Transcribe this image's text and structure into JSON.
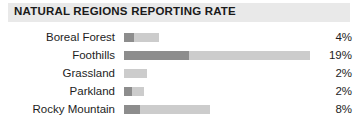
{
  "header": {
    "title": "NATURAL REGIONS REPORTING RATE",
    "band_color": "#e9e9e9"
  },
  "colors": {
    "bar_dark": "#8d8d8d",
    "bar_light": "#cccccc",
    "text": "#1d1d1d",
    "background": "#ffffff"
  },
  "chart_data": {
    "type": "bar",
    "title": "NATURAL REGIONS REPORTING RATE",
    "xlabel": "",
    "ylabel": "",
    "orientation": "horizontal",
    "grid": false,
    "legend": "none",
    "value_suffix": "%",
    "xlim": [
      0,
      19
    ],
    "categories": [
      "Boreal Forest",
      "Foothills",
      "Grassland",
      "Parkland",
      "Rocky Mountain"
    ],
    "values": [
      4,
      19,
      2,
      2,
      8
    ],
    "value_labels": [
      "4%",
      "19%",
      "2%",
      "2%",
      "8%"
    ],
    "segments": [
      {
        "category": "Boreal Forest",
        "dark_px": 10,
        "light_px": 25
      },
      {
        "category": "Foothills",
        "dark_px": 65,
        "light_px": 121
      },
      {
        "category": "Grassland",
        "dark_px": 0,
        "light_px": 23
      },
      {
        "category": "Parkland",
        "dark_px": 8,
        "light_px": 12
      },
      {
        "category": "Rocky Mountain",
        "dark_px": 16,
        "light_px": 70
      }
    ]
  }
}
